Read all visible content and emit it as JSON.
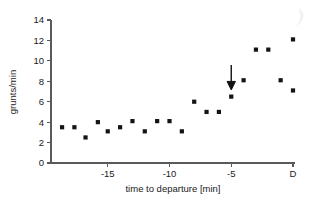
{
  "chart_data": {
    "type": "scatter",
    "title": "",
    "xlabel": "time to departure [min]",
    "ylabel": "grunts/min",
    "xlim": [
      -19.5,
      0.5
    ],
    "ylim": [
      0,
      14
    ],
    "xticks": [
      -15,
      -10,
      -5,
      0
    ],
    "xticklabels": [
      "-15",
      "-10",
      "-5",
      "D"
    ],
    "yticks": [
      0,
      2,
      4,
      6,
      8,
      10,
      12,
      14
    ],
    "yticklabels": [
      "0",
      "2",
      "4",
      "6",
      "8",
      "10",
      "12",
      "14"
    ],
    "grid": false,
    "legend": null,
    "marker": "square",
    "marker_color": "#141414",
    "x": [
      -18.7,
      -17.7,
      -16.8,
      -15.8,
      -15.0,
      -14.0,
      -13.0,
      -12.0,
      -11.0,
      -10.0,
      -9.0,
      -8.0,
      -7.0,
      -6.0,
      -5.0,
      -4.0,
      -3.0,
      -2.0,
      -1.0,
      0.0,
      0.0
    ],
    "y": [
      3.5,
      3.5,
      2.5,
      4.0,
      3.1,
      3.5,
      4.1,
      3.1,
      4.1,
      4.1,
      3.1,
      6.0,
      5.0,
      5.0,
      6.5,
      8.1,
      11.1,
      11.1,
      8.1,
      12.1,
      7.1
    ],
    "annotations": [
      {
        "kind": "arrow",
        "direction": "down",
        "x": -5.0,
        "y_tail": 9.6,
        "y_head": 7.4,
        "label": ""
      }
    ]
  },
  "axes": {
    "x_axis_name": "time to departure axis",
    "y_axis_name": "grunts per minute axis"
  }
}
